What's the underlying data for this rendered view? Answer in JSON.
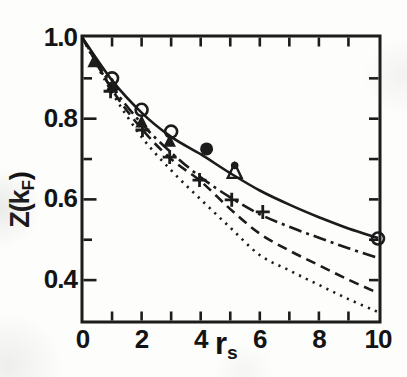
{
  "figure": {
    "background": "#fdfdfc",
    "ink_color": "#1a1a1a",
    "text_color": "#141414"
  },
  "axes": {
    "y_label": {
      "main": "Z(k",
      "sub": "F",
      "close": ")"
    },
    "x_label": {
      "main": "r",
      "sub": "s"
    },
    "y_tick_labels": [
      {
        "v": 1.0,
        "label": "1.0"
      },
      {
        "v": 0.8,
        "label": "0.8"
      },
      {
        "v": 0.6,
        "label": "0.6"
      },
      {
        "v": 0.4,
        "label": "0.4"
      }
    ],
    "x_tick_labels": [
      {
        "v": 0,
        "label": "0"
      },
      {
        "v": 2,
        "label": "2"
      },
      {
        "v": 4,
        "label": "4"
      },
      {
        "v": 6,
        "label": "6"
      },
      {
        "v": 8,
        "label": "8"
      },
      {
        "v": 10,
        "label": "10"
      }
    ]
  },
  "chart_data": {
    "type": "line",
    "title": "",
    "xlabel": "r_s",
    "ylabel": "Z(k_F)",
    "xlim": [
      0,
      10.07
    ],
    "ylim": [
      0.296,
      1.008
    ],
    "grid": false,
    "frame": "full-box",
    "x_ticks_bottom": [
      1,
      2,
      3,
      4,
      5,
      6,
      7,
      8,
      9
    ],
    "x_ticks_top": [
      1,
      2,
      3,
      4,
      5,
      6,
      7,
      8,
      9
    ],
    "y_ticks_left_major": [
      1.0,
      0.8,
      0.6,
      0.4
    ],
    "y_ticks_left_minor": [
      0.9,
      0.7,
      0.5
    ],
    "y_ticks_right": [
      0.9,
      0.8,
      0.7,
      0.6,
      0.5,
      0.4
    ],
    "x": [
      0,
      1,
      2,
      3,
      4,
      5,
      6,
      7,
      8,
      9,
      10
    ],
    "series": [
      {
        "name": "solid-curve",
        "style": "solid",
        "values": [
          1.0,
          0.895,
          0.815,
          0.755,
          0.712,
          0.665,
          0.622,
          0.587,
          0.556,
          0.528,
          0.504
        ]
      },
      {
        "name": "dash-dot-curve",
        "style": "dashdot",
        "values": [
          1.0,
          0.88,
          0.788,
          0.716,
          0.655,
          0.605,
          0.563,
          0.532,
          0.505,
          0.479,
          0.455
        ]
      },
      {
        "name": "dashed-curve",
        "style": "dashed",
        "values": [
          1.0,
          0.872,
          0.775,
          0.7,
          0.645,
          0.576,
          0.515,
          0.473,
          0.437,
          0.401,
          0.368
        ]
      },
      {
        "name": "dotted-curve",
        "style": "dotted",
        "values": [
          1.0,
          0.865,
          0.755,
          0.672,
          0.6,
          0.53,
          0.462,
          0.424,
          0.388,
          0.353,
          0.321
        ]
      }
    ],
    "markers": [
      {
        "name": "open-circle-points",
        "shape": "circle-open",
        "points": [
          [
            1.0,
            0.9
          ],
          [
            2.0,
            0.822
          ],
          [
            3.0,
            0.768
          ],
          [
            10.0,
            0.503
          ]
        ]
      },
      {
        "name": "filled-circle-point",
        "shape": "circle-filled",
        "points": [
          [
            4.2,
            0.725
          ]
        ]
      },
      {
        "name": "filled-triangle-points",
        "shape": "triangle-filled",
        "points": [
          [
            0.38,
            0.941
          ],
          [
            1.02,
            0.884
          ],
          [
            2.0,
            0.792
          ],
          [
            2.95,
            0.744
          ]
        ]
      },
      {
        "name": "open-triangle-dotted-apex-point",
        "shape": "triangle-open-dot",
        "points": [
          [
            5.15,
            0.668
          ]
        ]
      },
      {
        "name": "plus-points",
        "shape": "plus",
        "points": [
          [
            0.95,
            0.868
          ],
          [
            2.03,
            0.772
          ],
          [
            2.95,
            0.705
          ],
          [
            3.96,
            0.648
          ],
          [
            5.05,
            0.599
          ],
          [
            6.1,
            0.569
          ]
        ]
      }
    ]
  }
}
